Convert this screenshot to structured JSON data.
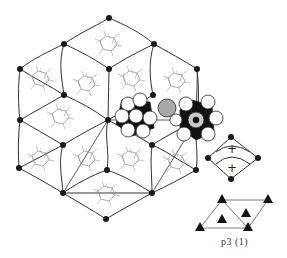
{
  "figure": {
    "lattice": {
      "line_color": "#333333",
      "node_color": "#1a1a1a",
      "nodes": [
        [
          109,
          18
        ],
        [
          64,
          44
        ],
        [
          154,
          44
        ],
        [
          20,
          69
        ],
        [
          109,
          69
        ],
        [
          197,
          69
        ],
        [
          64,
          95
        ],
        [
          153,
          95
        ],
        [
          20,
          120
        ],
        [
          108,
          120
        ],
        [
          197,
          120
        ],
        [
          63,
          145
        ],
        [
          152,
          145
        ],
        [
          19,
          168
        ],
        [
          107,
          170
        ],
        [
          196,
          170
        ],
        [
          63,
          193
        ],
        [
          152,
          193
        ],
        [
          106,
          219
        ]
      ]
    },
    "unit_cell": {
      "label_top": "+",
      "label_bottom": "+",
      "nodes": [
        [
          231,
          137
        ],
        [
          208,
          158
        ],
        [
          258,
          158
        ],
        [
          231,
          179
        ]
      ]
    },
    "symmetry_diagram": {
      "caption": "p3 (1)",
      "triangles": [
        [
          222,
          200
        ],
        [
          268,
          200
        ],
        [
          200,
          228
        ],
        [
          248,
          228
        ],
        [
          246,
          213
        ],
        [
          222,
          219
        ]
      ]
    },
    "molecule_models": [
      {
        "center": [
          135,
          115
        ],
        "type": "space-filling",
        "highlight_atom": "gray"
      },
      {
        "center": [
          196,
          120
        ],
        "type": "space-filling",
        "highlight_atom": "gray"
      }
    ]
  }
}
